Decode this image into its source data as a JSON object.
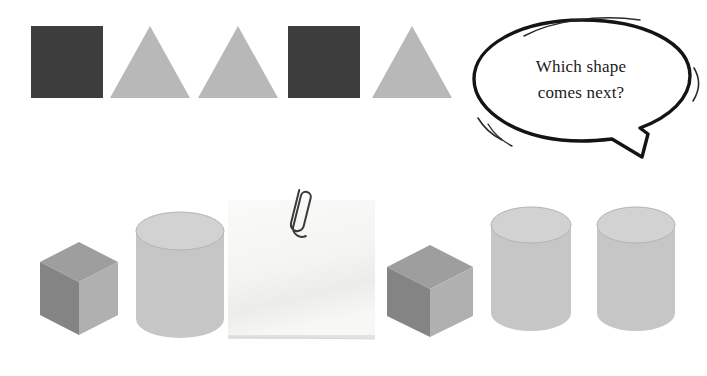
{
  "canvas": {
    "width": 707,
    "height": 376,
    "background": "#ffffff"
  },
  "speech_bubble": {
    "name": "speech-bubble",
    "line1": "Which shape",
    "line2": "comes next?",
    "full_text": "Which shape comes next?",
    "text_color": "#1a1a1a",
    "outline_color": "#141414",
    "fill_color": "#ffffff",
    "x": 462,
    "y": 8,
    "width": 240,
    "height": 168
  },
  "palette": {
    "dark_square": "#3d3d3d",
    "light_triangle": "#b8b8b8",
    "cube_top": "#9e9e9e",
    "cube_left": "#848484",
    "cube_right": "#b0b0b0",
    "cylinder_body": "#c6c6c6",
    "cylinder_top": "#d2d2d2",
    "cylinder_edge": "#b0b0b0",
    "note_paper": "#f6f6f4",
    "note_shadow": "#e2e2e0",
    "paperclip": "#2b2b2b",
    "background": "#ffffff"
  },
  "pattern_row": {
    "name": "2d-pattern-sequence",
    "description": "Two-dimensional shape pattern to continue",
    "shapes": [
      {
        "kind": "square",
        "label": "dark-square-1",
        "color": "#3d3d3d",
        "x": 31,
        "y": 26,
        "size": 72
      },
      {
        "kind": "triangle",
        "label": "light-triangle-1",
        "color": "#b8b8b8",
        "x": 110,
        "y": 26,
        "size": 80
      },
      {
        "kind": "triangle",
        "label": "light-triangle-2",
        "color": "#b8b8b8",
        "x": 198,
        "y": 26,
        "size": 80
      },
      {
        "kind": "square",
        "label": "dark-square-2",
        "color": "#3d3d3d",
        "x": 288,
        "y": 26,
        "size": 72
      },
      {
        "kind": "triangle",
        "label": "light-triangle-3",
        "color": "#b8b8b8",
        "x": 372,
        "y": 26,
        "size": 80
      }
    ]
  },
  "solids_row": {
    "name": "3d-solids-sequence",
    "description": "Three-dimensional solids with a blank note covering one position",
    "items": [
      {
        "kind": "cube",
        "label": "cube-1",
        "x": 38,
        "y": 55,
        "width": 80,
        "height": 95
      },
      {
        "kind": "cylinder",
        "label": "cylinder-1",
        "x": 133,
        "y": 26,
        "width": 92,
        "height": 127
      },
      {
        "kind": "note",
        "label": "sticky-note-blank",
        "x": 228,
        "y": 14,
        "width": 147,
        "height": 140
      },
      {
        "kind": "cube",
        "label": "cube-2",
        "x": 385,
        "y": 58,
        "width": 88,
        "height": 94
      },
      {
        "kind": "cylinder",
        "label": "cylinder-2",
        "x": 488,
        "y": 21,
        "width": 84,
        "height": 125
      },
      {
        "kind": "cylinder",
        "label": "cylinder-3",
        "x": 594,
        "y": 21,
        "width": 82,
        "height": 125
      }
    ]
  },
  "sticky_note": {
    "name": "sticky-note",
    "content": "",
    "has_paperclip": true,
    "paperclip_name": "paperclip-icon"
  }
}
